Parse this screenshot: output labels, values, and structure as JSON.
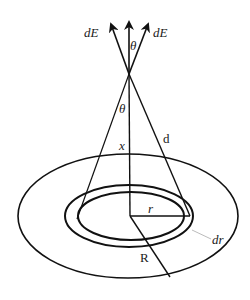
{
  "diagram": {
    "colors": {
      "stroke": "#111111",
      "leader": "#aaaaaa",
      "background": "#ffffff"
    },
    "labels": {
      "dE_left": "dE",
      "dE_right": "dE",
      "theta_top": "θ",
      "theta_cone": "θ",
      "x": "x",
      "d": "d",
      "r": "r",
      "dr": "dr",
      "R": "R"
    }
  }
}
